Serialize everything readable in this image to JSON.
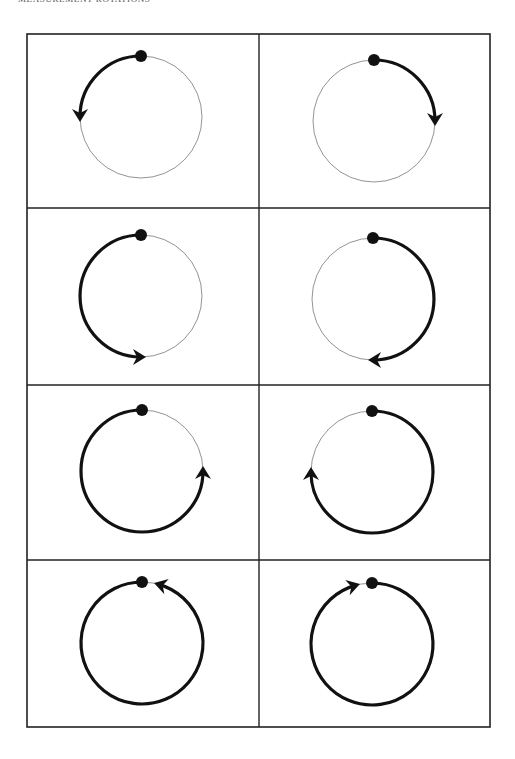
{
  "header": {
    "title": "MEASUREMENT ROTATIONS"
  },
  "colors": {
    "ink": "#111111",
    "thin": "#777777",
    "border": "#222222"
  },
  "grid": {
    "rows": 4,
    "cols": 2
  },
  "cells": [
    {
      "label": "quarter turn counter-clockwise",
      "turn_fraction": 0.25,
      "direction": "counterclockwise"
    },
    {
      "label": "quarter turn clockwise",
      "turn_fraction": 0.25,
      "direction": "clockwise"
    },
    {
      "label": "half turn counter-clockwise",
      "turn_fraction": 0.5,
      "direction": "counterclockwise"
    },
    {
      "label": "half turn clockwise",
      "turn_fraction": 0.5,
      "direction": "clockwise"
    },
    {
      "label": "three-quarter turn counter-clockwise",
      "turn_fraction": 0.75,
      "direction": "counterclockwise"
    },
    {
      "label": "three-quarter turn clockwise",
      "turn_fraction": 0.75,
      "direction": "clockwise"
    },
    {
      "label": "full turn counter-clockwise",
      "turn_fraction": 1.0,
      "direction": "counterclockwise"
    },
    {
      "label": "full turn clockwise",
      "turn_fraction": 1.0,
      "direction": "clockwise"
    }
  ]
}
